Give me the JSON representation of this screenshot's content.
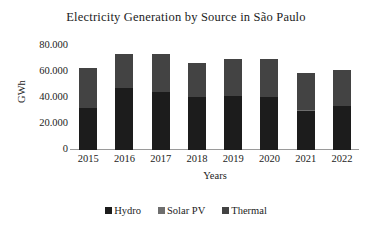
{
  "chart_data": {
    "type": "bar",
    "subtype": "stacked-column",
    "title": "Electricity Generation by Source in São Paulo",
    "xlabel": "Years",
    "ylabel": "GWh",
    "categories": [
      "2015",
      "2016",
      "2017",
      "2018",
      "2019",
      "2020",
      "2021",
      "2022"
    ],
    "series": [
      {
        "name": "Hydro",
        "color": "#1c1c1c",
        "values": [
          32000,
          47500,
          45000,
          40500,
          41500,
          41000,
          30000,
          33500
        ]
      },
      {
        "name": "Solar PV",
        "color": "#6e6e6e",
        "values": [
          0,
          0,
          0,
          0,
          0,
          0,
          500,
          500
        ]
      },
      {
        "name": "Thermal",
        "color": "#434343",
        "values": [
          31000,
          26500,
          28500,
          26500,
          28500,
          29000,
          29000,
          27500
        ]
      }
    ],
    "totals": [
      63000,
      74000,
      73500,
      67000,
      70000,
      70000,
      59500,
      61500
    ],
    "ylim": [
      0,
      80000
    ],
    "ytick_values": [
      0,
      20000,
      40000,
      60000,
      80000
    ],
    "ytick_labels": [
      "0",
      "20.000",
      "40.000",
      "60.000",
      "80.000"
    ],
    "grid": false,
    "legend_position": "bottom"
  }
}
